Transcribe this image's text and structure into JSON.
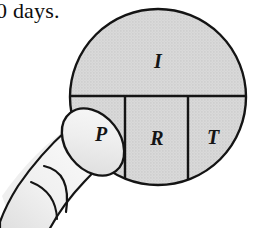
{
  "figure": {
    "name": "ohms-law-circle-with-finger",
    "caption_fragment": "0 days.",
    "colors": {
      "fill_gray": "#d4d4d4",
      "outline_black": "#111111",
      "finger_fill": "#f2f2f2",
      "finger_shadow": "#e3e3e3",
      "page_background": "#ffffff",
      "text_black": "#0d0d0d"
    },
    "circle": {
      "center_x": 158,
      "center_y": 97,
      "radius": 88,
      "divider_y": 96,
      "divider_x_left": 125,
      "divider_x_right": 188
    },
    "segments": [
      {
        "id": "top",
        "label": "I",
        "label_x": 158,
        "label_y": 68,
        "covered": false
      },
      {
        "id": "bottom-left",
        "label": "P",
        "label_x": 101,
        "label_y": 141,
        "covered": true
      },
      {
        "id": "bottom-middle",
        "label": "R",
        "label_x": 157,
        "label_y": 145,
        "covered": false
      },
      {
        "id": "bottom-right",
        "label": "T",
        "label_x": 213,
        "label_y": 144,
        "covered": false
      }
    ],
    "hand": {
      "name": "pointing-finger",
      "fingertip_label": "P",
      "fingertip_center_x": 93,
      "fingertip_center_y": 142
    }
  }
}
